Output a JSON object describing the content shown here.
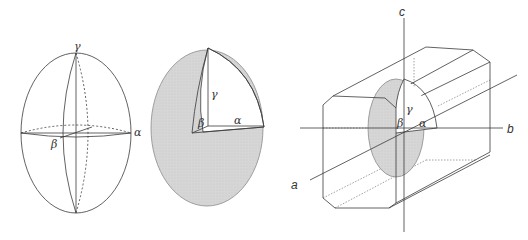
{
  "figure": {
    "panels": [
      {
        "id": "ellipsoid-axes",
        "description": "Indicatrix ellipsoid with principal axes",
        "labels": {
          "gamma": "γ",
          "alpha": "α",
          "beta": "β"
        }
      },
      {
        "id": "ellipsoid-cutaway",
        "description": "Shaded ellipsoid with octant cut away showing principal semi-axes",
        "labels": {
          "gamma": "γ",
          "alpha": "α",
          "beta": "β"
        },
        "fill_color": "#d4d4d4"
      },
      {
        "id": "crystal-orientation",
        "description": "Prismatic crystal with indicatrix oriented along crystallographic axes",
        "axis_labels": {
          "a": "a",
          "b": "b",
          "c": "c"
        },
        "labels": {
          "gamma": "γ",
          "alpha": "α",
          "beta": "β"
        },
        "fill_color": "#d4d4d4"
      }
    ],
    "colors": {
      "line": "#3a3a3a",
      "shade": "#d4d4d4",
      "background": "#ffffff"
    }
  }
}
